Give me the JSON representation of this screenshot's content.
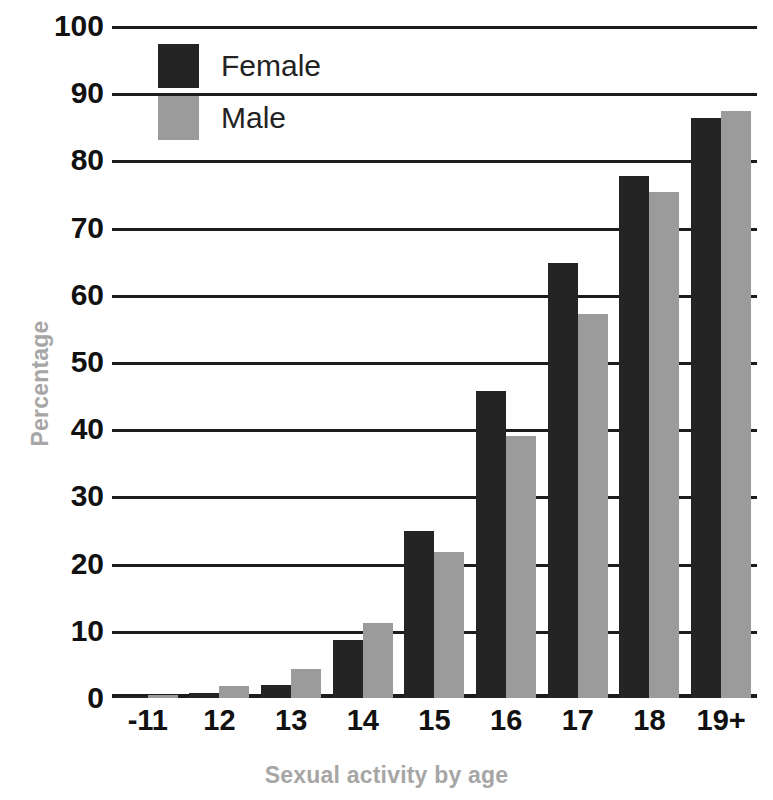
{
  "chart_data": {
    "type": "bar",
    "title": "",
    "xlabel": "Sexual activity by age",
    "ylabel": "Percentage",
    "categories": [
      "-11",
      "12",
      "13",
      "14",
      "15",
      "16",
      "17",
      "18",
      "19+"
    ],
    "series": [
      {
        "name": "Female",
        "color": "#242424",
        "values": [
          0.3,
          0.8,
          2.0,
          8.7,
          24.9,
          45.7,
          64.8,
          77.7,
          86.3
        ]
      },
      {
        "name": "Male",
        "color": "#9b9b9b",
        "values": [
          0.5,
          1.8,
          4.3,
          11.2,
          21.8,
          39.0,
          57.2,
          75.3,
          87.4
        ]
      }
    ],
    "ylim": [
      0,
      100
    ],
    "yticks": [
      "0",
      "10",
      "20",
      "30",
      "40",
      "50",
      "60",
      "70",
      "80",
      "90",
      "100"
    ],
    "ytick_values": [
      0,
      10,
      20,
      30,
      40,
      50,
      60,
      70,
      80,
      90,
      100
    ],
    "grid": true,
    "legend_position": "top-left",
    "legend": [
      {
        "label": "Female",
        "color": "#242424"
      },
      {
        "label": "Male",
        "color": "#9b9b9b"
      }
    ],
    "axis_color": "#1c1c1c",
    "axis_title_color": "#a6a6a6",
    "tick_label_color": "#111111"
  }
}
